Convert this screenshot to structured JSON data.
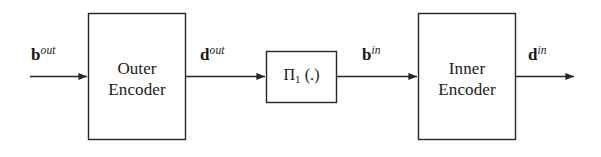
{
  "diagram": {
    "background_color": "#ffffff",
    "stroke_color": "#262626",
    "text_color": "#1a1a1a",
    "blocks": [
      {
        "id": "outer-encoder",
        "label": "Outer\nEncoder",
        "x": 88,
        "y": 13,
        "width": 98,
        "height": 127
      },
      {
        "id": "interleaver",
        "label_main": "Π",
        "label_sub": "1",
        "label_tail": " (.)",
        "x": 266,
        "y": 51,
        "width": 71,
        "height": 52
      },
      {
        "id": "inner-encoder",
        "label": "Inner\nEncoder",
        "x": 418,
        "y": 13,
        "width": 98,
        "height": 127
      }
    ],
    "signals": [
      {
        "id": "b-out",
        "base": "b",
        "sup": "out",
        "x": 31,
        "y": 44
      },
      {
        "id": "d-out",
        "base": "d",
        "sup": "out",
        "x": 200,
        "y": 44
      },
      {
        "id": "b-in",
        "base": "b",
        "sup": "in",
        "x": 362,
        "y": 44
      },
      {
        "id": "d-in",
        "base": "d",
        "sup": "in",
        "x": 528,
        "y": 44
      }
    ],
    "arrows": [
      {
        "id": "input-to-outer-encoder",
        "x1": 30,
        "x2": 88,
        "y": 76,
        "arrowhead": true
      },
      {
        "id": "outer-encoder-to-interleaver",
        "x1": 186,
        "x2": 266,
        "y": 76,
        "arrowhead": true
      },
      {
        "id": "interleaver-to-inner-encoder",
        "x1": 337,
        "x2": 418,
        "y": 76,
        "arrowhead": true
      },
      {
        "id": "inner-encoder-to-output",
        "x1": 516,
        "x2": 575,
        "y": 76,
        "arrowhead": true
      }
    ]
  }
}
